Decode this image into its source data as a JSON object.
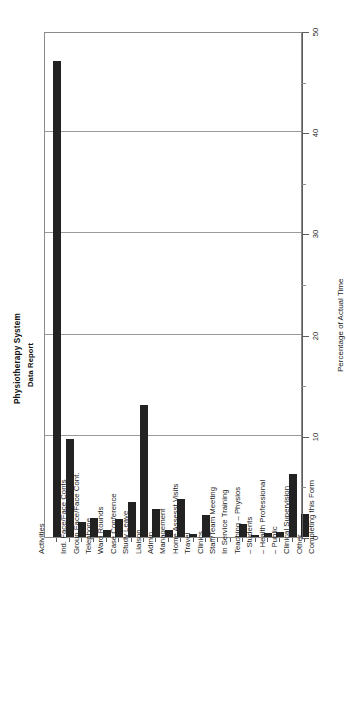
{
  "report": {
    "title": "Physiotherapy System",
    "subtitle": "Data Report"
  },
  "chart_data": {
    "type": "bar",
    "title": "Physiotherapy System",
    "subtitle": "Data Report",
    "orientation": "vertical-bars-rotated-page",
    "xlabel": "Activities",
    "ylabel": "Percentage of Actual Time",
    "ylim": [
      0,
      50
    ],
    "yticks": [
      0,
      10,
      20,
      30,
      40,
      50
    ],
    "yminorticks": [
      5,
      15,
      25,
      35,
      45
    ],
    "grid": true,
    "legend": false,
    "bar_color": "#222222",
    "categories": [
      "Ind. Face/Face Conts",
      "Group Face/Face Cont.",
      "Telephone",
      "Ward Rounds",
      "Case Conference",
      "Study Leave",
      "Liaison",
      "Admin.",
      "Management",
      "Home Assesst Visits",
      "Travel",
      "Clinics",
      "Staff/Team Meeting",
      "In Service Training",
      "Teaching  –  Physios",
      "–  Students",
      "–  Health Professional",
      "–  Public",
      "Clinical Supervision",
      "Other",
      "Completing this Form"
    ],
    "values": [
      47,
      9.7,
      1.5,
      1.9,
      0.7,
      1.8,
      3.5,
      13,
      2.8,
      0.7,
      3.8,
      0.3,
      2.2,
      0,
      0,
      1.3,
      0.2,
      0.4,
      0.5,
      6.2,
      2.3
    ]
  }
}
